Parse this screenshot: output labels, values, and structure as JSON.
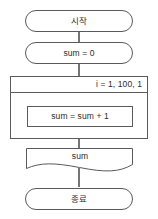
{
  "diagram": {
    "type": "flowchart",
    "title": "",
    "language": "ko",
    "background_color": "#ffffff",
    "stroke_color": "#5a5a5a",
    "text_color": "#2b2b2b",
    "nodes": [
      {
        "id": "start",
        "shape": "terminator",
        "label": "시작",
        "align": "center"
      },
      {
        "id": "init",
        "shape": "terminator",
        "label": "sum = 0",
        "align": "center"
      },
      {
        "id": "loop",
        "shape": "loop-container",
        "label": "i = 1, 100, 1",
        "align": "right"
      },
      {
        "id": "body",
        "shape": "process",
        "label": "sum = sum + 1",
        "align": "center"
      },
      {
        "id": "output",
        "shape": "document",
        "label": "sum",
        "align": "center"
      },
      {
        "id": "end",
        "shape": "terminator",
        "label": "종료",
        "align": "center"
      }
    ],
    "edges": [
      {
        "from": "start",
        "to": "init"
      },
      {
        "from": "init",
        "to": "loop"
      },
      {
        "from": "loop",
        "to": "body"
      },
      {
        "from": "body",
        "to": "output"
      },
      {
        "from": "output",
        "to": "end"
      }
    ]
  }
}
